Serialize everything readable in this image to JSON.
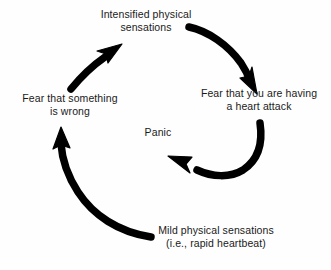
{
  "diagram": {
    "type": "cycle-flow",
    "background_color": "#fefefe",
    "arrow_color": "#000000",
    "text_color": "#1a1a1a",
    "center_label": "Panic",
    "nodes": [
      {
        "id": "intensified",
        "line1": "Intensified physical",
        "line2": "sensations",
        "position": "top"
      },
      {
        "id": "fear-heart-attack",
        "line1": "Fear that you are having",
        "line2": "a heart attack",
        "position": "right"
      },
      {
        "id": "mild-sensations",
        "line1": "Mild physical sensations",
        "line2": "(i.e., rapid heartbeat)",
        "position": "bottom"
      },
      {
        "id": "fear-something-wrong",
        "line1": "Fear that something",
        "line2": "is wrong",
        "position": "left"
      }
    ],
    "arrows": [
      {
        "id": "arrow-top-right",
        "from": "intensified",
        "to": "fear-heart-attack",
        "direction": "clockwise-down-right"
      },
      {
        "id": "arrow-right-inner",
        "from": "fear-heart-attack",
        "to": "panic-center",
        "direction": "curve-down-left"
      },
      {
        "id": "arrow-bottom-left",
        "from": "mild-sensations",
        "to": "fear-something-wrong",
        "direction": "sweep-left-up"
      },
      {
        "id": "arrow-left-top",
        "from": "fear-something-wrong",
        "to": "intensified",
        "direction": "up-right"
      }
    ]
  }
}
